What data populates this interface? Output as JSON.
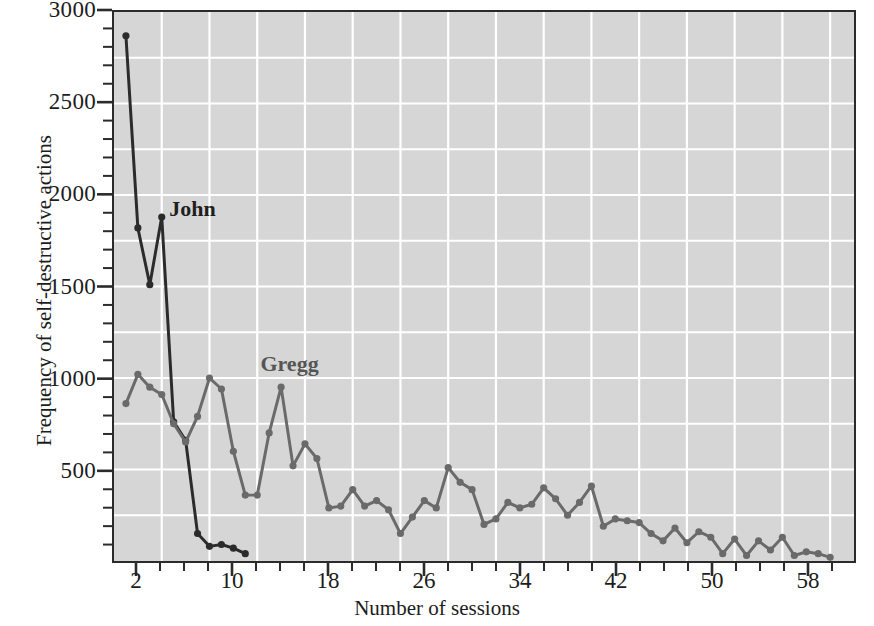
{
  "chart_data": {
    "type": "line",
    "title": "",
    "xlabel": "Number of sessions",
    "ylabel": "Frequency of self-destructive actions",
    "xlim": [
      0,
      62
    ],
    "ylim": [
      0,
      3000
    ],
    "xticks": [
      2,
      10,
      18,
      26,
      34,
      42,
      50,
      58
    ],
    "xtick_labels": [
      "2",
      "10",
      "18",
      "26",
      "34",
      "42",
      "50",
      "58"
    ],
    "xtick_minor_step": 2,
    "yticks": [
      500,
      1000,
      1500,
      2000,
      2500,
      3000
    ],
    "ytick_labels": [
      "500",
      "1000",
      "1500",
      "2000",
      "2500",
      "3000"
    ],
    "ytick_minor_step": 100,
    "grid": true,
    "grid_color": "#ffffff",
    "grid_x_step": 4,
    "grid_y_step": 250,
    "plot_background": "#d6d6d6",
    "frame_color": "#2b2b2b",
    "legend": "inline-annotations",
    "legend_position": "on-plot",
    "series": [
      {
        "name": "John",
        "color": "#2b2b2b",
        "marker": "circle",
        "label_x": 4.6,
        "label_y": 1930,
        "x": [
          1,
          2,
          3,
          4,
          5,
          6,
          7,
          8,
          9,
          10,
          11
        ],
        "values": [
          2870,
          1820,
          1510,
          1880,
          760,
          660,
          150,
          80,
          90,
          70,
          40
        ]
      },
      {
        "name": "Gregg",
        "color": "#6a6a6a",
        "marker": "circle",
        "label_x": 12.2,
        "label_y": 1090,
        "x": [
          1,
          2,
          3,
          4,
          5,
          6,
          7,
          8,
          9,
          10,
          11,
          12,
          13,
          14,
          15,
          16,
          17,
          18,
          19,
          20,
          21,
          22,
          23,
          24,
          25,
          26,
          27,
          28,
          29,
          30,
          31,
          32,
          33,
          34,
          35,
          36,
          37,
          38,
          39,
          40,
          41,
          42,
          43,
          44,
          45,
          46,
          47,
          48,
          49,
          50,
          51,
          52,
          53,
          54,
          55,
          56,
          57,
          58,
          59,
          60
        ],
        "values": [
          860,
          1020,
          950,
          910,
          750,
          650,
          790,
          1000,
          940,
          600,
          360,
          360,
          700,
          950,
          520,
          640,
          560,
          290,
          300,
          390,
          300,
          330,
          280,
          150,
          240,
          330,
          290,
          510,
          430,
          390,
          200,
          230,
          320,
          290,
          310,
          400,
          340,
          250,
          320,
          410,
          190,
          230,
          220,
          210,
          150,
          110,
          180,
          100,
          160,
          130,
          40,
          120,
          30,
          110,
          60,
          130,
          30,
          50,
          40,
          20
        ]
      }
    ]
  },
  "annotations": {
    "john_label": "John",
    "gregg_label": "Gregg"
  }
}
